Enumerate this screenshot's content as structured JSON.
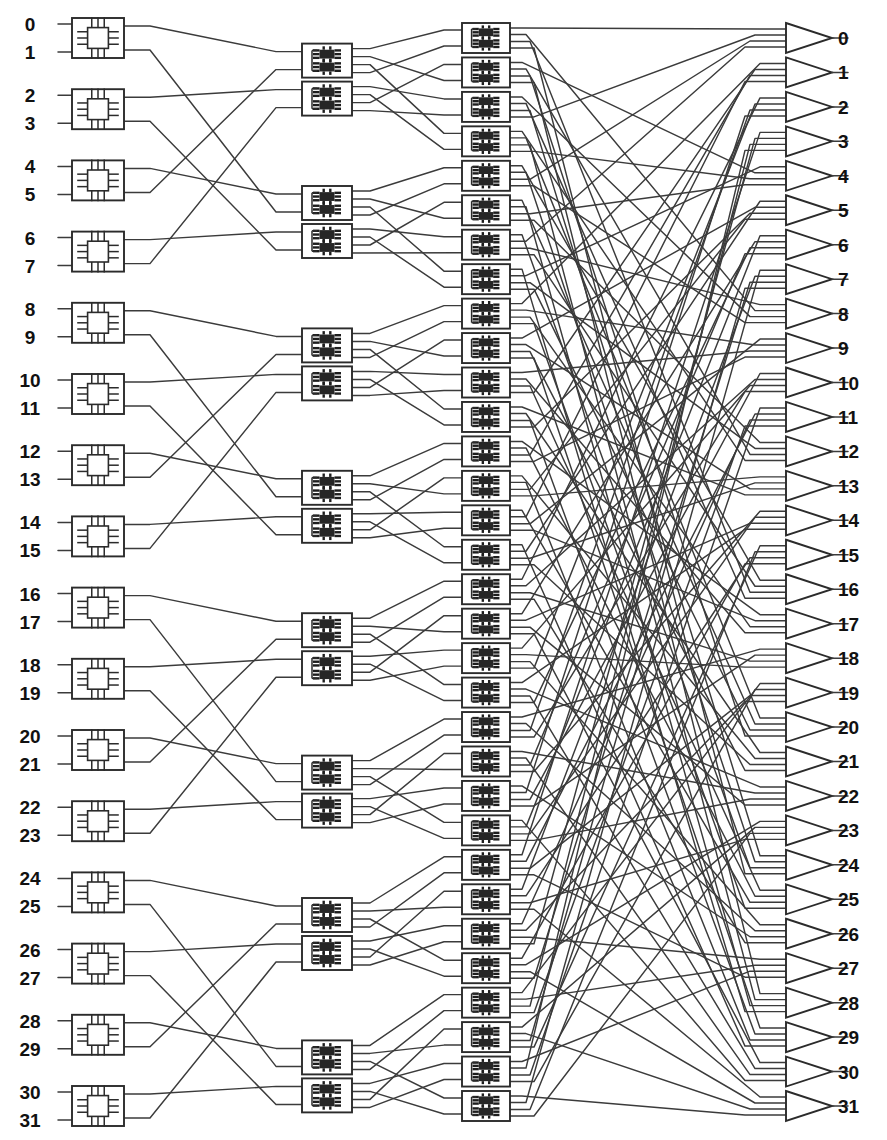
{
  "figure": {
    "caption": "",
    "network_size": 32,
    "stage_count": 3
  },
  "inputs": {
    "label": "Network inputs",
    "labels": [
      "0",
      "1",
      "2",
      "3",
      "4",
      "5",
      "6",
      "7",
      "8",
      "9",
      "10",
      "11",
      "12",
      "13",
      "14",
      "15",
      "16",
      "17",
      "18",
      "19",
      "20",
      "21",
      "22",
      "23",
      "24",
      "25",
      "26",
      "27",
      "28",
      "29",
      "30",
      "31"
    ]
  },
  "outputs": {
    "label": "Network outputs",
    "labels": [
      "0",
      "1",
      "2",
      "3",
      "4",
      "5",
      "6",
      "7",
      "8",
      "9",
      "10",
      "11",
      "12",
      "13",
      "14",
      "15",
      "16",
      "17",
      "18",
      "19",
      "20",
      "21",
      "22",
      "23",
      "24",
      "25",
      "26",
      "27",
      "28",
      "29",
      "30",
      "31"
    ]
  },
  "stages": [
    {
      "name": "stage-1",
      "element_label": "2x2 switch module",
      "icon": "chip-icon",
      "box_count": 16,
      "inputs_per_box": 2,
      "outputs_per_box": 2
    },
    {
      "name": "stage-2",
      "element_label": "switch module",
      "icon": "dual-chip-icon",
      "box_count": 16,
      "inputs_per_box": 2,
      "outputs_per_box": 4
    },
    {
      "name": "stage-3",
      "element_label": "switch module",
      "icon": "dual-chip-icon",
      "box_count": 32,
      "inputs_per_box": 2,
      "outputs_per_box": 4
    }
  ],
  "output_buffers": {
    "element_label": "output buffer",
    "icon": "triangle-buffer-icon",
    "count": 32
  },
  "colors": {
    "background": "#ffffff",
    "wire": "#3b3b3b",
    "outline": "#2b2b2b",
    "label": "#111111"
  },
  "geometry": {
    "width": 887,
    "height": 1140,
    "label_x": 30,
    "stage1_x": 72,
    "stage1_w": 52,
    "stage2_x": 302,
    "stage2_w": 50,
    "stage3_x": 462,
    "stage3_w": 48,
    "buffer_x": 786,
    "out_label_x": 838
  }
}
